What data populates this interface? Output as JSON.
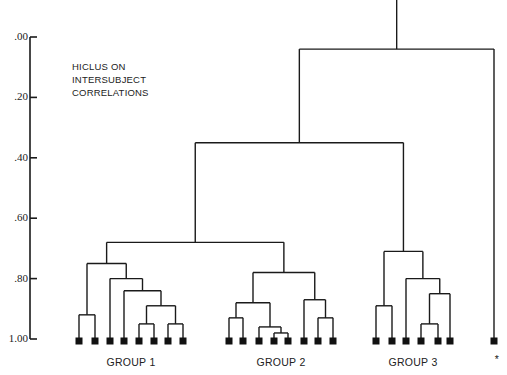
{
  "chart_data": {
    "type": "dendrogram",
    "title": "HICLUS ON INTERSUBJECT CORRELATIONS",
    "title_lines": [
      "HICLUS ON",
      "INTERSUBJECT",
      "CORRELATIONS"
    ],
    "ylabel": "",
    "xlabel": "",
    "y_axis": {
      "ticks": [
        ".00",
        ".20",
        ".40",
        ".60",
        ".80",
        "1.00"
      ],
      "tick_values": [
        0.0,
        0.2,
        0.4,
        0.6,
        0.8,
        1.0
      ],
      "range": [
        0.0,
        1.0
      ],
      "direction": "top-to-bottom"
    },
    "grid": false,
    "legend": null,
    "groups": [
      {
        "label": "GROUP 1",
        "leaf_count": 8
      },
      {
        "label": "GROUP 2",
        "leaf_count": 8
      },
      {
        "label": "GROUP 3",
        "leaf_count": 6
      },
      {
        "label": "*",
        "leaf_count": 1
      }
    ],
    "leaves": [
      {
        "id": "g1a",
        "group": "GROUP 1",
        "x": 79
      },
      {
        "id": "g1b",
        "group": "GROUP 1",
        "x": 95
      },
      {
        "id": "g1c",
        "group": "GROUP 1",
        "x": 110
      },
      {
        "id": "g1d",
        "group": "GROUP 1",
        "x": 124
      },
      {
        "id": "g1e",
        "group": "GROUP 1",
        "x": 139
      },
      {
        "id": "g1f",
        "group": "GROUP 1",
        "x": 154
      },
      {
        "id": "g1g",
        "group": "GROUP 1",
        "x": 168
      },
      {
        "id": "g1h",
        "group": "GROUP 1",
        "x": 183
      },
      {
        "id": "g2a",
        "group": "GROUP 2",
        "x": 229
      },
      {
        "id": "g2b",
        "group": "GROUP 2",
        "x": 243
      },
      {
        "id": "g2c",
        "group": "GROUP 2",
        "x": 259
      },
      {
        "id": "g2d",
        "group": "GROUP 2",
        "x": 274
      },
      {
        "id": "g2e",
        "group": "GROUP 2",
        "x": 288
      },
      {
        "id": "g2f",
        "group": "GROUP 2",
        "x": 304
      },
      {
        "id": "g2g",
        "group": "GROUP 2",
        "x": 318
      },
      {
        "id": "g2h",
        "group": "GROUP 2",
        "x": 333
      },
      {
        "id": "g3a",
        "group": "GROUP 3",
        "x": 376
      },
      {
        "id": "g3b",
        "group": "GROUP 3",
        "x": 392
      },
      {
        "id": "g3c",
        "group": "GROUP 3",
        "x": 406
      },
      {
        "id": "g3d",
        "group": "GROUP 3",
        "x": 421
      },
      {
        "id": "g3e",
        "group": "GROUP 3",
        "x": 438
      },
      {
        "id": "g3f",
        "group": "GROUP 3",
        "x": 450
      },
      {
        "id": "out",
        "group": "*",
        "x": 494
      }
    ],
    "merges": [
      {
        "id": "m1",
        "children": [
          "g1a",
          "g1b"
        ],
        "height": 0.92
      },
      {
        "id": "m2",
        "children": [
          "g1e",
          "g1f"
        ],
        "height": 0.95
      },
      {
        "id": "m3",
        "children": [
          "g1g",
          "g1h"
        ],
        "height": 0.95
      },
      {
        "id": "m4",
        "children": [
          "m2",
          "m3"
        ],
        "height": 0.89
      },
      {
        "id": "m5",
        "children": [
          "g1d",
          "m4"
        ],
        "height": 0.84
      },
      {
        "id": "m6",
        "children": [
          "g1c",
          "m5"
        ],
        "height": 0.8
      },
      {
        "id": "m7",
        "children": [
          "m1",
          "m6"
        ],
        "height": 0.75
      },
      {
        "id": "m8",
        "children": [
          "g2a",
          "g2b"
        ],
        "height": 0.93
      },
      {
        "id": "m9",
        "children": [
          "g2d",
          "g2e"
        ],
        "height": 0.98
      },
      {
        "id": "m10",
        "children": [
          "g2c",
          "m9"
        ],
        "height": 0.96
      },
      {
        "id": "m11",
        "children": [
          "m8",
          "m10"
        ],
        "height": 0.88
      },
      {
        "id": "m12",
        "children": [
          "g2g",
          "g2h"
        ],
        "height": 0.93
      },
      {
        "id": "m13",
        "children": [
          "g2f",
          "m12"
        ],
        "height": 0.87
      },
      {
        "id": "m14",
        "children": [
          "m11",
          "m13"
        ],
        "height": 0.78
      },
      {
        "id": "m15",
        "children": [
          "m7",
          "m14"
        ],
        "height": 0.68
      },
      {
        "id": "m16",
        "children": [
          "g3a",
          "g3b"
        ],
        "height": 0.89
      },
      {
        "id": "m17",
        "children": [
          "g3d",
          "g3e"
        ],
        "height": 0.95
      },
      {
        "id": "m18",
        "children": [
          "m17",
          "g3f"
        ],
        "height": 0.85
      },
      {
        "id": "m19",
        "children": [
          "g3c",
          "m18"
        ],
        "height": 0.8
      },
      {
        "id": "m20",
        "children": [
          "m16",
          "m19"
        ],
        "height": 0.71
      },
      {
        "id": "m21",
        "children": [
          "m15",
          "m20"
        ],
        "height": 0.35
      },
      {
        "id": "m22",
        "children": [
          "m21",
          "out"
        ],
        "height": 0.04
      }
    ]
  },
  "labels": {
    "title_line_1": "HICLUS ON",
    "title_line_2": "INTERSUBJECT",
    "title_line_3": "CORRELATIONS",
    "tick_0": ".00",
    "tick_1": ".20",
    "tick_2": ".40",
    "tick_3": ".60",
    "tick_4": ".80",
    "tick_5": "1.00",
    "group_1": "GROUP 1",
    "group_2": "GROUP 2",
    "group_3": "GROUP 3",
    "outlier": "*"
  }
}
